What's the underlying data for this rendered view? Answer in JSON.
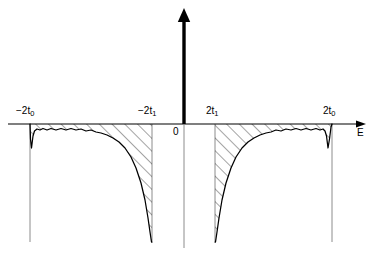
{
  "figure": {
    "type": "density-of-states-diagram",
    "background_color": "#ffffff",
    "ink_color": "#000000",
    "guide_color": "#8c8c8c",
    "width": 377,
    "height": 260
  },
  "axes": {
    "x_axis": {
      "name": "E",
      "label": "E",
      "arrow": true,
      "y_pixel": 124,
      "x_start": 8,
      "x_end": 366
    },
    "y_axis": {
      "label": "",
      "arrow": true,
      "x_pixel": 184,
      "y_top": 8,
      "y_bottom": 248
    },
    "origin": {
      "label": "0",
      "x_pixel": 184,
      "y_pixel": 124
    }
  },
  "ticks": [
    {
      "id": "neg-2t0",
      "label": "−2t",
      "sub": "0",
      "x_pixel": 30,
      "side": "left"
    },
    {
      "id": "neg-2t1",
      "label": "−2t",
      "sub": "1",
      "x_pixel": 152,
      "side": "left"
    },
    {
      "id": "pos-2t1",
      "label": "2t",
      "sub": "1",
      "x_pixel": 215,
      "side": "right"
    },
    {
      "id": "pos-2t0",
      "label": "2t",
      "sub": "0",
      "x_pixel": 332,
      "side": "right"
    }
  ],
  "band_edges": {
    "inner_left": -152,
    "inner_right": 215,
    "outer_left": 30,
    "outer_right": 332,
    "vertical_guide_bottom": 242
  },
  "chart_data": {
    "type": "area",
    "title": "",
    "xlabel": "E",
    "ylabel": "",
    "hatch_angle_deg": 45,
    "hatch_spacing_px": 9,
    "axis_y_px": 124,
    "left_lobe": {
      "edge_outer_label": "−2t0",
      "edge_inner_label": "−2t1",
      "points": [
        [
          30,
          124
        ],
        [
          30.5,
          139
        ],
        [
          31.5,
          148
        ],
        [
          33,
          136
        ],
        [
          34.5,
          131
        ],
        [
          37,
          129
        ],
        [
          40,
          130
        ],
        [
          43,
          128.5
        ],
        [
          47,
          130
        ],
        [
          51,
          128.5
        ],
        [
          56,
          130
        ],
        [
          61,
          128.5
        ],
        [
          66,
          130
        ],
        [
          71,
          128.5
        ],
        [
          76,
          130
        ],
        [
          81,
          129
        ],
        [
          86,
          131
        ],
        [
          91,
          130
        ],
        [
          96,
          132
        ],
        [
          101,
          133
        ],
        [
          107,
          135
        ],
        [
          113,
          138
        ],
        [
          119,
          142
        ],
        [
          125,
          148
        ],
        [
          131,
          157
        ],
        [
          136,
          168
        ],
        [
          141,
          183
        ],
        [
          145,
          200
        ],
        [
          148,
          218
        ],
        [
          150,
          232
        ],
        [
          151.5,
          242
        ],
        [
          152,
          242
        ]
      ]
    },
    "right_lobe": {
      "edge_inner_label": "2t1",
      "edge_outer_label": "2t0",
      "points": [
        [
          215,
          242
        ],
        [
          215.5,
          242
        ],
        [
          217,
          232
        ],
        [
          219,
          218
        ],
        [
          222,
          200
        ],
        [
          226,
          183
        ],
        [
          231,
          168
        ],
        [
          236,
          157
        ],
        [
          242,
          148
        ],
        [
          248,
          142
        ],
        [
          254,
          138
        ],
        [
          260,
          135
        ],
        [
          266,
          133
        ],
        [
          271,
          132
        ],
        [
          276,
          130
        ],
        [
          281,
          131
        ],
        [
          286,
          129
        ],
        [
          291,
          130
        ],
        [
          296,
          128.5
        ],
        [
          301,
          130
        ],
        [
          306,
          128.5
        ],
        [
          311,
          130
        ],
        [
          316,
          128.5
        ],
        [
          320,
          130
        ],
        [
          323,
          129
        ],
        [
          325,
          131
        ],
        [
          326.5,
          136
        ],
        [
          328,
          148
        ],
        [
          329.5,
          139
        ],
        [
          331,
          127
        ],
        [
          332,
          124
        ]
      ]
    }
  }
}
